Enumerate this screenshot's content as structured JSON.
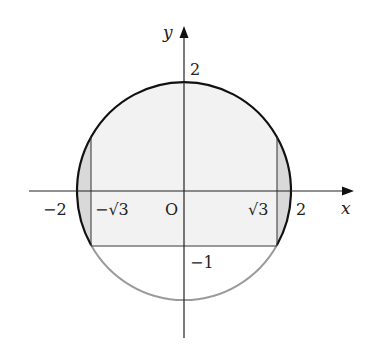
{
  "diagram": {
    "type": "coordinate-plane-region",
    "axes": {
      "x_label": "x",
      "y_label": "y",
      "origin_label": "O"
    },
    "tick_labels": {
      "x_neg_2": "−2",
      "x_neg_sqrt3": "−√3",
      "x_pos_sqrt3": "√3",
      "x_pos_2": "2",
      "y_pos_2": "2",
      "y_neg_1": "−1"
    },
    "geometry": {
      "circle": {
        "center": [
          0,
          0
        ],
        "radius": 2
      },
      "horizontal_line": {
        "y": -1,
        "x_from": "-√3",
        "x_to": "√3"
      },
      "vertical_lines": [
        {
          "x": "-√3",
          "y_from": -1,
          "y_to": 1
        },
        {
          "x": "√3",
          "y_from": -1,
          "y_to": 1
        }
      ]
    },
    "colors": {
      "rect_fill": "#f2f2f2",
      "segment_fill": "#d9d9d9",
      "dark_stroke": "#111111",
      "light_stroke": "#9a9a9a",
      "axis_stroke": "#222222"
    }
  }
}
